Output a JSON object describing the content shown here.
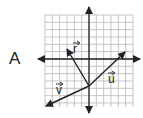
{
  "problem": {
    "label": "A"
  },
  "diagram": {
    "grid": {
      "x0": 45,
      "y0": 15,
      "x1": 133,
      "y1": 107,
      "step": 7.33,
      "color": "#b8b8b8"
    },
    "axes": {
      "origin_x": 89,
      "origin_y": 59,
      "x_min": 38,
      "x_max": 140,
      "y_min": 7,
      "y_max": 113,
      "color": "#222222"
    },
    "vector_origin": {
      "x": 89,
      "y": 86
    },
    "vectors": [
      {
        "name": "r",
        "label": "r",
        "tip": {
          "x": 67,
          "y": 49
        },
        "label_pos": {
          "x": 73,
          "y": 53
        }
      },
      {
        "name": "u",
        "label": "u",
        "tip": {
          "x": 125,
          "y": 52
        },
        "label_pos": {
          "x": 108,
          "y": 83
        }
      },
      {
        "name": "v",
        "label": "v",
        "tip": {
          "x": 46,
          "y": 106
        },
        "label_pos": {
          "x": 56,
          "y": 94
        }
      }
    ]
  }
}
